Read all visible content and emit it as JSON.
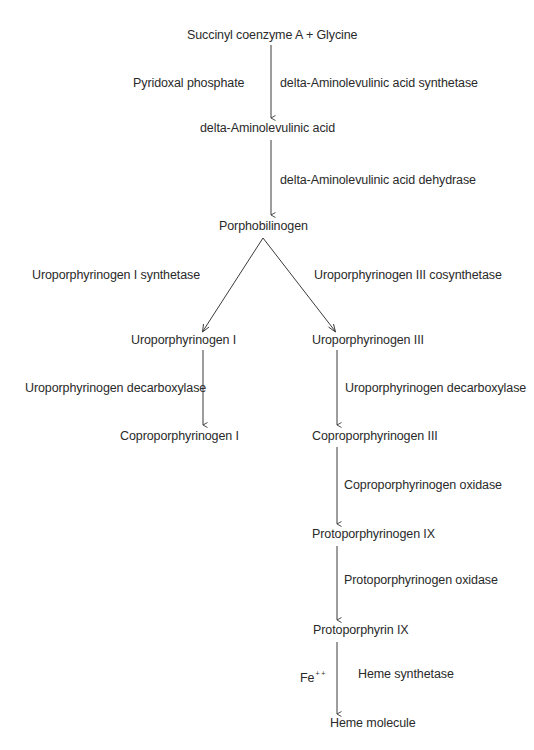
{
  "diagram": {
    "nodes": {
      "start": "Succinyl coenzyme A + Glycine",
      "ala": "delta-Aminolevulinic acid",
      "pbg": "Porphobilinogen",
      "uro1": "Uroporphyrinogen I",
      "uro3": "Uroporphyrinogen III",
      "copro1": "Coproporphyrinogen I",
      "copro3": "Coproporphyrinogen III",
      "protogen9": "Protoporphyrinogen IX",
      "proto9": "Protoporphyrin IX",
      "heme": "Heme molecule"
    },
    "cofactors": {
      "pyridoxal": "Pyridoxal phosphate",
      "fe": "Fe",
      "fe_charge": "+ +"
    },
    "enzymes": {
      "ala_synthetase": "delta-Aminolevulinic acid synthetase",
      "ala_dehydrase": "delta-Aminolevulinic acid dehydrase",
      "uro1_synthetase": "Uroporphyrinogen I synthetase",
      "uro3_cosynthetase": "Uroporphyrinogen III cosynthetase",
      "uro_decarboxylase_left": "Uroporphyrinogen decarboxylase",
      "uro_decarboxylase_right": "Uroporphyrinogen decarboxylase",
      "copro_oxidase": "Coproporphyrinogen oxidase",
      "protogen_oxidase": "Protoporphyrinogen oxidase",
      "heme_synthetase": "Heme synthetase"
    },
    "colors": {
      "text": "#2a2a2a",
      "line": "#3a3a3a",
      "background": "#ffffff"
    }
  }
}
